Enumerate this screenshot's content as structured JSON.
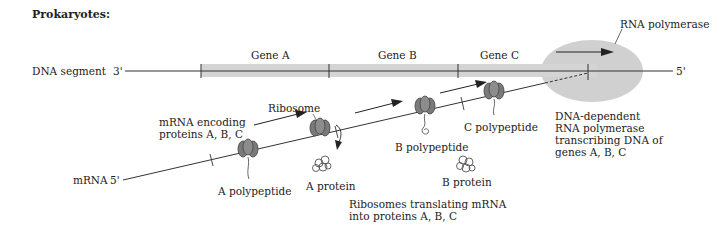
{
  "title": "Prokaryotes:",
  "dna": {
    "label": "DNA segment",
    "end_left": "3'",
    "end_right": "5'",
    "genes": [
      {
        "label": "Gene A"
      },
      {
        "label": "Gene B"
      },
      {
        "label": "Gene C"
      }
    ],
    "gene_color": "#d4d4d4"
  },
  "polymerase": {
    "label": "RNA polymerase",
    "color": "#cfcfcf",
    "caption": "DNA-dependent\nRNA polymerase\ntranscribing DNA of\ngenes A, B, C"
  },
  "mrna": {
    "label": "mRNA",
    "end": "5'",
    "encoding_caption": "mRNA encoding\nproteins A, B, C"
  },
  "ribosome": {
    "label": "Ribosome",
    "color": "#7a7a7a"
  },
  "products": {
    "a_polypeptide": "A polypeptide",
    "a_protein": "A protein",
    "b_polypeptide": "B polypeptide",
    "b_protein": "B protein",
    "c_polypeptide": "C polypeptide"
  },
  "translation_caption": "Ribosomes translating mRNA\ninto proteins A, B, C"
}
